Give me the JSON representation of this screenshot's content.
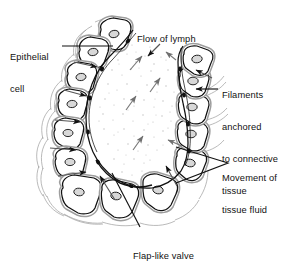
{
  "figure": {
    "background_color": "#ffffff",
    "ink_color": "#111111",
    "wisp_color": "#9a9a9a",
    "stipple_color": "#b9b9b9"
  },
  "labels": {
    "epithelial": {
      "line1": "Epithelial",
      "line2": "cell"
    },
    "flow": {
      "line1": "Flow of lymph"
    },
    "filaments": {
      "line1": "Filaments",
      "line2": "anchored",
      "line3": "to connective",
      "line4": "tissue"
    },
    "movement": {
      "line1": "Movement of",
      "line2": "tissue fluid"
    },
    "flap": {
      "line1": "Flap-like valve"
    }
  },
  "diagram": {
    "lumen_label": "lumen",
    "cell_count": 14,
    "nucleus_label": "nucleus",
    "arrow_names": [
      "lymph-flow-arrow",
      "tissue-fluid-inflow-arrow",
      "anchoring-filament-dot"
    ]
  }
}
